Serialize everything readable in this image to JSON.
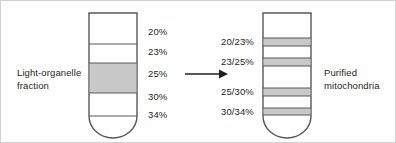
{
  "figure": {
    "title_alt": "Sucrose gradient purification of mitochondria",
    "background_color": "#ffffff",
    "border_color": "#d2d2d2",
    "line_color": "#58585b",
    "band_fill_color": "#c8c8c8",
    "text_color": "#231f20"
  },
  "left_panel": {
    "caption_line1": "Light-organelle",
    "caption_line2": "fraction",
    "tube_name": "gradient-tube-before",
    "gradient_labels": [
      {
        "text": "20%",
        "y": 31
      },
      {
        "text": "23%",
        "y": 51
      },
      {
        "text": "25%",
        "y": 73
      },
      {
        "text": "30%",
        "y": 96
      },
      {
        "text": "34%",
        "y": 114
      }
    ],
    "bands": [
      {
        "name": "light-organelle-band",
        "top": 62,
        "height": 30,
        "shaded": true
      }
    ],
    "layer_lines_y": [
      12,
      43,
      62,
      92,
      115
    ]
  },
  "arrow": {
    "name": "transfer-arrow",
    "direction": "right"
  },
  "right_panel": {
    "caption_line1": "Purified",
    "caption_line2": "mitochondria",
    "tube_name": "gradient-tube-after",
    "gradient_labels": [
      {
        "text": "20/23%",
        "y": 41
      },
      {
        "text": "23/25%",
        "y": 61
      },
      {
        "text": "25/30%",
        "y": 91
      },
      {
        "text": "30/34%",
        "y": 111
      }
    ],
    "bands": [
      {
        "name": "band-20-23",
        "top": 37,
        "height": 8
      },
      {
        "name": "band-23-25",
        "top": 57,
        "height": 8
      },
      {
        "name": "band-25-30",
        "top": 87,
        "height": 8
      },
      {
        "name": "band-30-34",
        "top": 107,
        "height": 7
      }
    ]
  }
}
